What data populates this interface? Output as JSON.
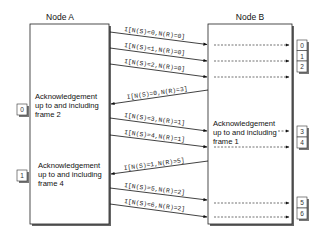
{
  "nodes": {
    "a": {
      "title": "Node A"
    },
    "b": {
      "title": "Node B"
    }
  },
  "acknowledgements": {
    "node_a_first": [
      "Acknowledgement",
      "up to and including",
      "frame 2"
    ],
    "node_a_second": [
      "Acknowledgement",
      "up to and including",
      "frame 4"
    ],
    "node_b_first": [
      "Acknowledgement",
      "up to and including",
      "frame 1"
    ]
  },
  "messages": [
    {
      "label": "I[N(S)=0,N(R)=0]",
      "direction": "a-to-b",
      "delivered_frame": "0"
    },
    {
      "label": "I[N(S)=1,N(R)=0]",
      "direction": "a-to-b",
      "delivered_frame": "1"
    },
    {
      "label": "I[N(S)=2,N(R)=0]",
      "direction": "a-to-b",
      "delivered_frame": "2"
    },
    {
      "label": "I[N(S)=0,N(R)=3]",
      "direction": "b-to-a",
      "delivered_frame": "0"
    },
    {
      "label": "I[N(S)=3,N(R)=1]",
      "direction": "a-to-b",
      "delivered_frame": "3"
    },
    {
      "label": "I[N(S)=4,N(R)=1]",
      "direction": "a-to-b",
      "delivered_frame": "4"
    },
    {
      "label": "I[N(S)=1,N(R)=5]",
      "direction": "b-to-a",
      "delivered_frame": "1"
    },
    {
      "label": "I[N(S)=5,N(R)=2]",
      "direction": "a-to-b",
      "delivered_frame": "5"
    },
    {
      "label": "I[N(S)=6,N(R)=2]",
      "direction": "a-to-b",
      "delivered_frame": "6"
    }
  ],
  "colors": {
    "line": "#111111",
    "shadow": "#555555",
    "box_fill": "#ffffff",
    "dashed": "#333333"
  }
}
